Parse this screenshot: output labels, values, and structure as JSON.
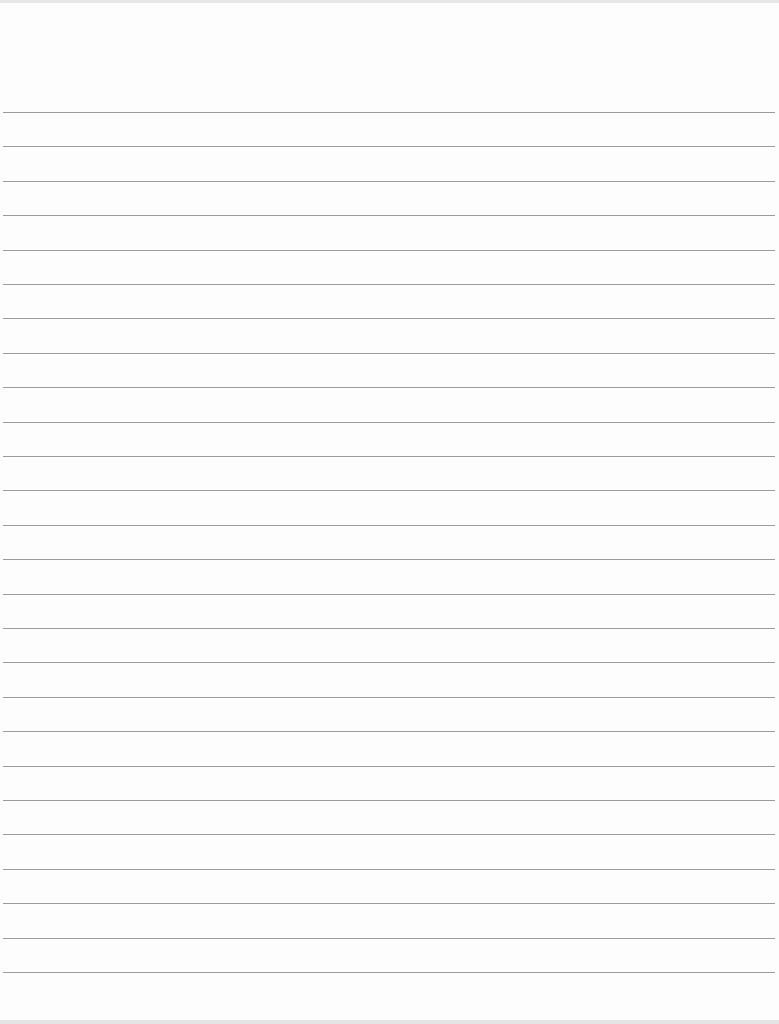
{
  "page": {
    "type": "lined-paper",
    "background_color": "#fdfdfd",
    "rule_color": "#9c9c9c",
    "rule_count": 26,
    "first_rule_y": 112,
    "rule_spacing": 34.4,
    "rule_left": 3,
    "rule_width": 772
  }
}
